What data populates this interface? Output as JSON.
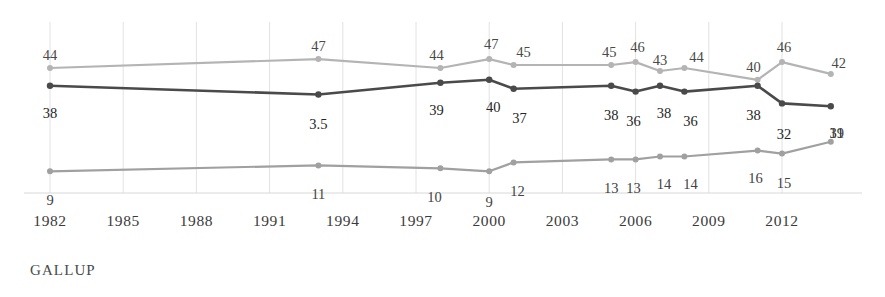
{
  "chart_data": {
    "type": "line",
    "title": "",
    "xlabel": "",
    "ylabel": "",
    "xlim": [
      1982,
      2014
    ],
    "ylim": [
      0,
      50
    ],
    "grid": "vertical",
    "legend": "none",
    "tick_labels": [
      "1982",
      "1985",
      "1988",
      "1991",
      "1994",
      "1997",
      "2000",
      "2003",
      "2006",
      "2009",
      "2012"
    ],
    "tick_years": [
      1982,
      1985,
      1988,
      1991,
      1994,
      1997,
      2000,
      2003,
      2006,
      2009,
      2012
    ],
    "x": [
      1982,
      1993,
      1998,
      2000,
      2001,
      2005,
      2006,
      2007,
      2008,
      2011,
      2012,
      2014
    ],
    "series": [
      {
        "name": "top-series",
        "color": "#b4b4b4",
        "values": [
          44,
          47,
          44,
          47,
          45,
          45,
          46,
          43,
          44,
          40,
          46,
          42
        ],
        "labels": [
          "44",
          "47",
          "44",
          "47",
          "45",
          "45",
          "46",
          "43",
          "44",
          "40",
          "46",
          "42"
        ],
        "label_side": "above"
      },
      {
        "name": "middle-series",
        "color": "#4a4a4a",
        "values": [
          38,
          35,
          39,
          40,
          37,
          38,
          36,
          38,
          36,
          38,
          32,
          31
        ],
        "labels": [
          "38",
          "3.5",
          "39",
          "40",
          "37",
          "38",
          "36",
          "38",
          "36",
          "38",
          "32",
          "31"
        ],
        "label_side": "below"
      },
      {
        "name": "bottom-series",
        "color": "#a0a0a0",
        "values": [
          9,
          11,
          10,
          9,
          12,
          13,
          13,
          14,
          14,
          16,
          15,
          19
        ],
        "labels": [
          "9",
          "11",
          "10",
          "9",
          "12",
          "13",
          "13",
          "14",
          "14",
          "16",
          "15",
          "19"
        ],
        "label_side": "below"
      }
    ]
  },
  "source": {
    "label": "GALLUP"
  },
  "colors": {
    "top_line": "#b4b4b4",
    "middle_line": "#4a4a4a",
    "bottom_line": "#a0a0a0",
    "gridline": "#e2e2e2",
    "axis": "#d8d8d8",
    "text": "#3a3a3a",
    "background": "#ffffff"
  }
}
